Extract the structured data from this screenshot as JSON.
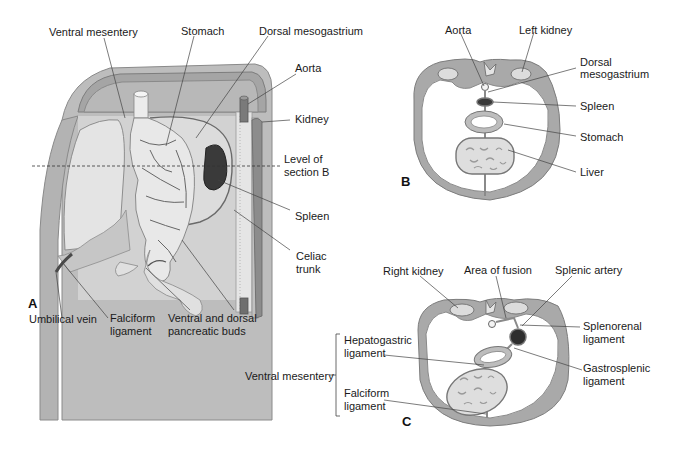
{
  "figure": {
    "panels": [
      {
        "id": "A",
        "label": "A"
      },
      {
        "id": "B",
        "label": "B"
      },
      {
        "id": "C",
        "label": "C"
      }
    ],
    "panel_a": {
      "labels": {
        "ventral_mesentery": "Ventral mesentery",
        "stomach": "Stomach",
        "dorsal_mesogastrium": "Dorsal mesogastrium",
        "aorta": "Aorta",
        "kidney": "Kidney",
        "level_of_section_b_1": "Level of",
        "level_of_section_b_2": "section B",
        "spleen": "Spleen",
        "celiac_trunk_1": "Celiac",
        "celiac_trunk_2": "trunk",
        "umbilical_vein": "Umbilical vein",
        "falciform_1": "Falciform",
        "falciform_2": "ligament",
        "pancreatic_1": "Ventral and dorsal",
        "pancreatic_2": "pancreatic buds"
      }
    },
    "panel_b": {
      "labels": {
        "aorta": "Aorta",
        "left_kidney": "Left kidney",
        "dorsal_mesogastrium_1": "Dorsal",
        "dorsal_mesogastrium_2": "mesogastrium",
        "spleen": "Spleen",
        "stomach": "Stomach",
        "liver": "Liver"
      }
    },
    "panel_c": {
      "labels": {
        "right_kidney": "Right kidney",
        "area_of_fusion": "Area of fusion",
        "splenic_artery": "Splenic artery",
        "splenorenal_1": "Splenorenal",
        "splenorenal_2": "ligament",
        "hepatogastric_1": "Hepatogastric",
        "hepatogastric_2": "ligament",
        "ventral_mesentery": "Ventral mesentery",
        "gastrosplenic_1": "Gastrosplenic",
        "gastrosplenic_2": "ligament",
        "falciform_1": "Falciform",
        "falciform_2": "ligament"
      }
    },
    "colors": {
      "wall": "#a9a9a9",
      "wall_light": "#c9c9c9",
      "cavity": "#d4d4d4",
      "organ_light": "#e6e6e6",
      "spleen": "#3a3a3a",
      "line": "#555555"
    }
  }
}
